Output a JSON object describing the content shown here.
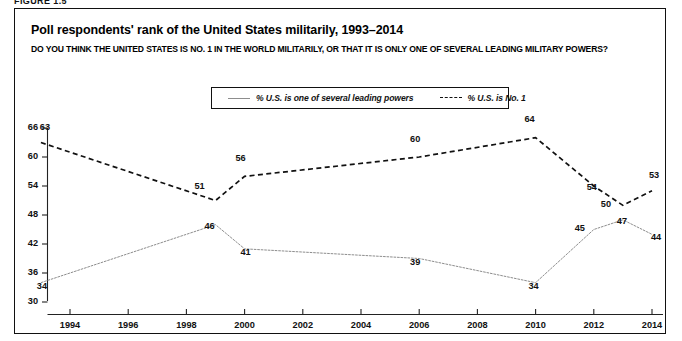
{
  "figure": {
    "label": "FIGURE 1.5",
    "title": "Poll respondents' rank of the United States militarily, 1993–2014",
    "subtitle": "DO YOU THINK THE UNITED STATES IS NO. 1 IN THE WORLD MILITARILY, OR THAT IT IS ONLY ONE OF SEVERAL LEADING MILITARY POWERS?"
  },
  "legend": {
    "position": "top-center",
    "items": [
      {
        "label": "% U.S. is one of several leading powers",
        "style": "solid",
        "color": "#8d8d8d",
        "icon": "line-solid-icon"
      },
      {
        "label": "% U.S. is No. 1",
        "style": "dashed",
        "color": "#111111",
        "icon": "line-dashed-icon"
      }
    ]
  },
  "chart_data": {
    "type": "line",
    "title": "Poll respondents' rank of the United States militarily, 1993–2014",
    "xlabel": "",
    "ylabel": "",
    "xlim": [
      1993,
      2014.6
    ],
    "ylim": [
      30,
      66
    ],
    "yticks": [
      30,
      36,
      42,
      48,
      54,
      60,
      66
    ],
    "xticks": [
      1994,
      1996,
      1998,
      2000,
      2002,
      2004,
      2006,
      2008,
      2010,
      2012,
      2014
    ],
    "grid": false,
    "series": [
      {
        "name": "% U.S. is No. 1",
        "style": "dashed",
        "color": "#111111",
        "x": [
          1993,
          1999,
          2000,
          2006,
          2010,
          2012,
          2013,
          2014
        ],
        "values": [
          63,
          51,
          56,
          60,
          64,
          54,
          50,
          53
        ]
      },
      {
        "name": "% U.S. is one of several leading powers",
        "style": "solid",
        "color": "#8d8d8d",
        "x": [
          1993,
          1999,
          2000,
          2006,
          2010,
          2012,
          2013,
          2014
        ],
        "values": [
          34,
          46,
          41,
          39,
          34,
          45,
          47,
          44
        ]
      }
    ]
  },
  "ytick_labels": [
    "66",
    "60",
    "54",
    "48",
    "42",
    "36",
    "30"
  ],
  "xtick_labels": [
    "1994",
    "1996",
    "1998",
    "2000",
    "2002",
    "2004",
    "2006",
    "2008",
    "2010",
    "2012",
    "2014"
  ],
  "point_labels": {
    "no1": [
      "63",
      "51",
      "56",
      "60",
      "64",
      "54",
      "50",
      "53"
    ],
    "powers": [
      "34",
      "46",
      "41",
      "39",
      "34",
      "45",
      "47",
      "44"
    ]
  }
}
